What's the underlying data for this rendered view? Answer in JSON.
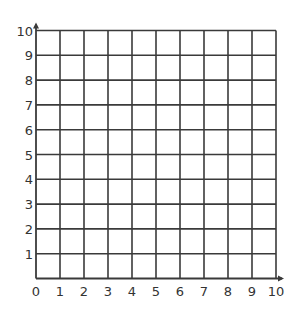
{
  "chart_data": {
    "type": "scatter",
    "title": "",
    "xlabel": "",
    "ylabel": "",
    "xlim": [
      0,
      10
    ],
    "ylim": [
      0,
      10
    ],
    "grid": true,
    "x_ticks": [
      "0",
      "1",
      "2",
      "3",
      "4",
      "5",
      "6",
      "7",
      "8",
      "9",
      "10"
    ],
    "y_ticks": [
      "1",
      "2",
      "3",
      "4",
      "5",
      "6",
      "7",
      "8",
      "9",
      "10"
    ],
    "series": [],
    "axis_arrows": {
      "x": true,
      "y": true
    },
    "colors": {
      "grid": "#3a3a3a",
      "text": "#333333",
      "background": "#ffffff"
    }
  }
}
